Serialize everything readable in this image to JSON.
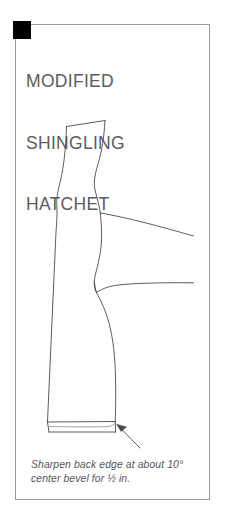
{
  "page": {
    "width": 225,
    "height": 516,
    "background_color": "#ffffff"
  },
  "frame": {
    "border_color": "#9a9a9a",
    "corner_mark_color": "#000000",
    "corner_mark_name": "black-square-corner-marker"
  },
  "title": {
    "lines": [
      "MODIFIED",
      "SHINGLING",
      "HATCHET"
    ],
    "line1": "MODIFIED",
    "line2": "SHINGLING",
    "line3": "HATCHET",
    "full_text": "MODIFIED SHINGLING HATCHET",
    "color": "#5c5c5c"
  },
  "figure": {
    "name": "hatchet-profile-line-drawing",
    "subject": "modified shingling hatchet",
    "stroke_color": "#4a4a4a",
    "bevel_stroke_color": "#8b8b8b",
    "annotation": {
      "arrow_name": "bevel-callout-arrow",
      "points_to": "back edge of blade"
    }
  },
  "caption": {
    "lines": [
      "Sharpen back edge at about 10°",
      "center bevel for ½ in."
    ],
    "line1": "Sharpen back edge at about 10°",
    "line2": "center bevel for ½ in.",
    "full_text": "Sharpen back edge at about 10° center bevel for ½ in.",
    "angle": "10°",
    "bevel_length": "½ in.",
    "color": "#56565a"
  }
}
